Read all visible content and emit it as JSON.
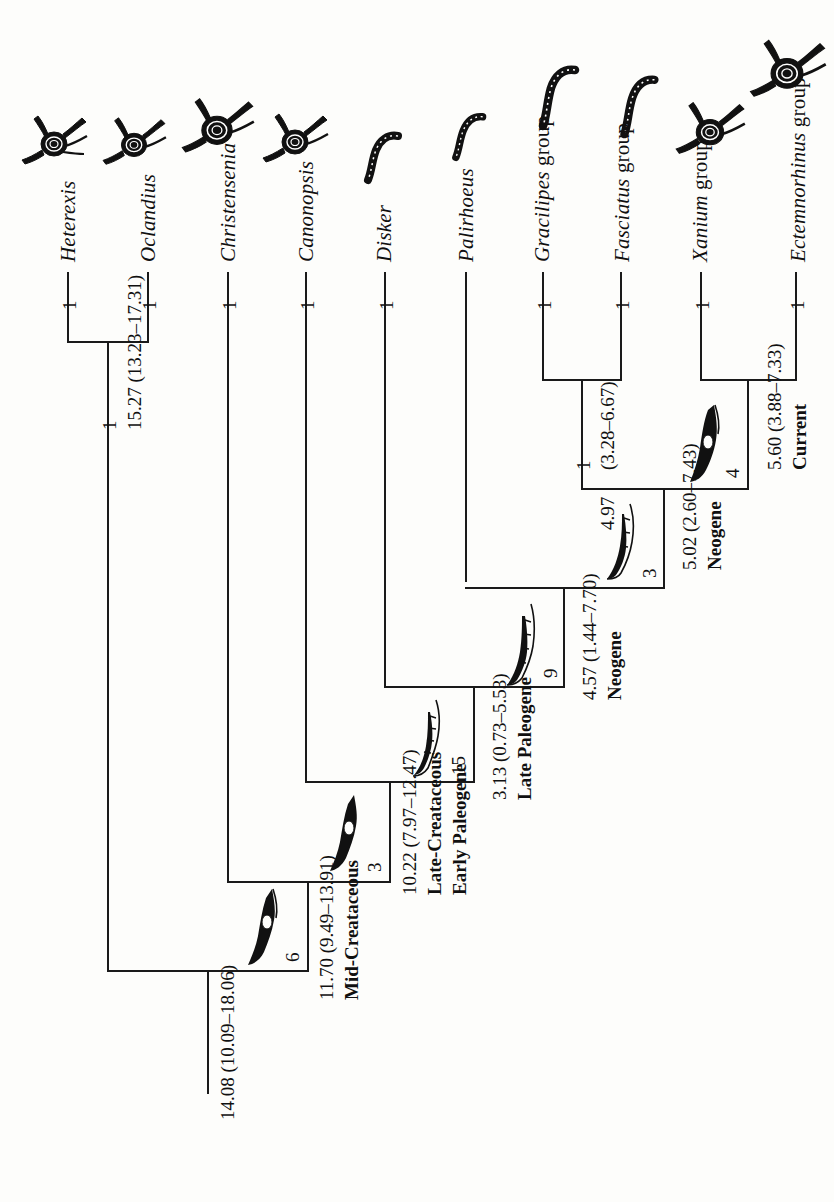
{
  "figure": {
    "type": "phylogenetic-tree",
    "orientation": "rotated-90-left",
    "root_age_label": "14.08 (10.09–18.06)"
  },
  "taxa": [
    {
      "id": "heterexis",
      "name": "Heterexis",
      "icon": "weevil-icon",
      "support": "1"
    },
    {
      "id": "oclandius",
      "name": "Oclandius",
      "icon": "weevil-icon",
      "support": "1"
    },
    {
      "id": "christensenia",
      "name": "Christensenia",
      "icon": "weevil-icon",
      "support": "1"
    },
    {
      "id": "canonopsis",
      "name": "Canonopsis",
      "icon": "weevil-icon",
      "support": "1"
    },
    {
      "id": "disker",
      "name": "Disker",
      "icon": "larva-icon",
      "support": "1"
    },
    {
      "id": "palirhoeus",
      "name": "Palirhoeus",
      "icon": "larva-icon",
      "support": ""
    },
    {
      "id": "gracilipes",
      "name": "Gracilipes",
      "suffix": " group",
      "icon": "larva-icon",
      "support": "1"
    },
    {
      "id": "fasciatus",
      "name": "Fasciatus",
      "suffix": " group",
      "icon": "larva-icon",
      "support": "1"
    },
    {
      "id": "xanium",
      "name": "Xanium",
      "suffix": " group",
      "icon": "weevil-icon",
      "support": "1"
    },
    {
      "id": "ectemnorhinus",
      "name": "Ectemnorhinus",
      "suffix": " group",
      "icon": "weevil-icon",
      "support": "1"
    }
  ],
  "nodes": [
    {
      "id": "n-heterexis-oclandius",
      "support": "1",
      "age": "15.27 (13.23–17.31)",
      "period": "",
      "count": ""
    },
    {
      "id": "n-gracilipes-fasciatus",
      "support": "1",
      "age": "(3.28–6.67)",
      "age_prefix": "4.97",
      "period": "",
      "count": "3"
    },
    {
      "id": "n-xanium-ectemnorhinus",
      "support": "",
      "age": "5.60 (3.88–7.33)",
      "period": "Current",
      "count": "4"
    },
    {
      "id": "n-neogene-late",
      "support": "",
      "age": "5.02 (2.60–7.43)",
      "period": "Neogene",
      "count": ""
    },
    {
      "id": "n-neogene-early",
      "support": "",
      "age": "4.57 (1.44–7.70)",
      "period": "Neogene",
      "count": "9"
    },
    {
      "id": "n-late-paleogene",
      "support": "",
      "age": "3.13 (0.73–5.53)",
      "period": "Late Paleogene",
      "count": "15"
    },
    {
      "id": "n-late-cret-early-pal",
      "support": "",
      "age": "10.22 (7.97–12.47)",
      "period": "Late-Creataceous Early Paleogene",
      "count": "3"
    },
    {
      "id": "n-mid-cretaceous",
      "support": "",
      "age": "11.70 (9.49–13.91)",
      "period": "Mid-Creataceous",
      "count": "6"
    },
    {
      "id": "n-root",
      "support": "",
      "age": "14.08 (10.09–18.06)",
      "period": "",
      "count": ""
    }
  ],
  "labels": {
    "support_values": [
      "1",
      "1",
      "1",
      "1",
      "1",
      "1",
      "1",
      "1",
      "1",
      "1",
      "1",
      "1"
    ],
    "age_root": "14.08 (10.09–18.06)",
    "age_mid_cret": "11.70 (9.49–13.91)",
    "period_mid_cret": "Mid-Creataceous",
    "count_mid_cret": "6",
    "age_late_cret": "10.22 (7.97–12.47)",
    "period_late_cret_1": "Late-Creataceous",
    "period_late_cret_2": "Early Paleogene",
    "count_late_cret": "3",
    "age_late_paleogene": "3.13 (0.73–5.53)",
    "period_late_paleogene": "Late Paleogene",
    "count_late_paleogene": "15",
    "age_neogene_1": "4.57 (1.44–7.70)",
    "period_neogene_1": "Neogene",
    "count_neogene_1": "9",
    "age_neogene_2": "5.02 (2.60–7.43)",
    "period_neogene_2": "Neogene",
    "count_neogene_2": "3",
    "age_gracilipes": "4.97",
    "age_gracilipes_ci": "(3.28–6.67)",
    "support_gracilipes": "1",
    "age_current": "5.60 (3.88–7.33)",
    "period_current": "Current",
    "count_current": "4",
    "age_heterexis": "15.27 (13.23–17.31)",
    "support_heterexis": "1"
  },
  "colors": {
    "line": "#1a1a1a",
    "text": "#101010",
    "background": "#fdfdfb",
    "silhouette_fill": "#111111"
  }
}
